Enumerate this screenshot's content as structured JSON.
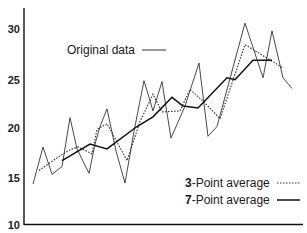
{
  "chart_data": {
    "type": "line",
    "title": "",
    "xlabel": "",
    "ylabel": "",
    "ylim": [
      10,
      31
    ],
    "yticks": [
      10,
      15,
      20,
      25,
      30
    ],
    "grid": false,
    "legend_position": "inside (original top-left, averages bottom-right)",
    "series": [
      {
        "name": "Original data",
        "style": "thin solid",
        "x": [
          33,
          43,
          52,
          62,
          70,
          77,
          89,
          95,
          100,
          107,
          116,
          125,
          134,
          144,
          153,
          162,
          171,
          185,
          199,
          208,
          217,
          245,
          263,
          272,
          283,
          292
        ],
        "values": [
          14.1,
          17.9,
          15.1,
          15.9,
          20.9,
          17.7,
          15.2,
          18.2,
          20.0,
          21.8,
          17.5,
          14.2,
          19.5,
          24.7,
          21.6,
          24.6,
          18.8,
          22.1,
          26.5,
          19.0,
          20.0,
          30.6,
          25.0,
          29.8,
          25.0,
          23.9
        ]
      },
      {
        "name": "3-Point average",
        "style": "dotted",
        "x": [
          39,
          63,
          72,
          78,
          92,
          97,
          107,
          127,
          140,
          153,
          162,
          180,
          190,
          203,
          220,
          245,
          283
        ],
        "values": [
          15.5,
          17.2,
          17.7,
          17.9,
          17.2,
          19.7,
          20.3,
          16.5,
          20.5,
          23.3,
          21.5,
          21.6,
          23.8,
          22.6,
          20.8,
          28.4,
          26.0
        ]
      },
      {
        "name": "7-Point average",
        "style": "thick solid",
        "x": [
          62,
          90,
          107,
          137,
          153,
          172,
          183,
          198,
          227,
          235,
          253,
          272
        ],
        "values": [
          16.5,
          18.2,
          17.7,
          20.0,
          21.0,
          23.0,
          22.1,
          21.9,
          25.0,
          24.8,
          26.8,
          26.8
        ]
      }
    ]
  },
  "axes": {
    "y_labels": [
      "30",
      "25",
      "20",
      "15",
      "10"
    ]
  },
  "legend": {
    "original": "Original data",
    "three_num": "3",
    "three_rest": "-Point average",
    "seven_num": "7",
    "seven_rest": "-Point average"
  }
}
